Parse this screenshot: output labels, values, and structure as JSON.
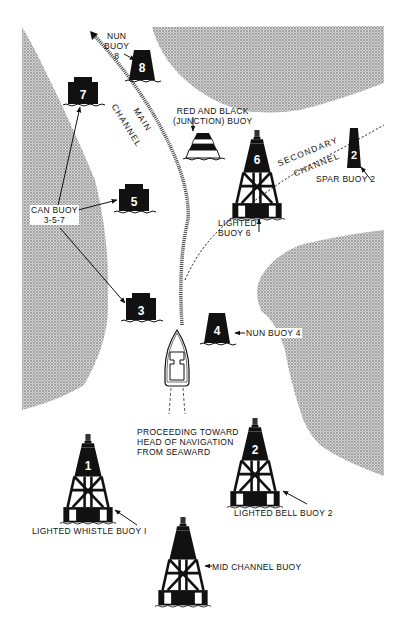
{
  "diagram": {
    "colors": {
      "land": "#b8b8b8",
      "land_dot": "#8c8c8c",
      "ink": "#111111",
      "water": "#ffffff"
    },
    "channels": {
      "main": {
        "label_line1": "MAIN",
        "label_line2": "CHANNEL"
      },
      "secondary": {
        "label_line1": "SECONDARY",
        "label_line2": "CHANNEL"
      }
    },
    "buoys": {
      "nun8": {
        "number": "8",
        "label_line1": "NUN",
        "label_line2": "BUOY",
        "label_line3": "8"
      },
      "can7": {
        "number": "7"
      },
      "can5": {
        "number": "5"
      },
      "can3": {
        "number": "3"
      },
      "can_label": {
        "line1": "CAN BUOY",
        "line2": "3-5-7"
      },
      "junction": {
        "label_line1": "RED AND BLACK",
        "label_line2": "(JUNCTION) BUOY"
      },
      "lighted6": {
        "number": "6",
        "label_line1": "LIGHTED",
        "label_line2": "BUOY 6"
      },
      "spar2": {
        "number": "2",
        "label": "SPAR BUOY 2"
      },
      "nun4": {
        "number": "4",
        "label": "NUN BUOY 4"
      },
      "whistle1": {
        "number": "1",
        "label": "LIGHTED WHISTLE BUOY I"
      },
      "bell2": {
        "number": "2",
        "label": "LIGHTED BELL BUOY 2"
      },
      "midchannel": {
        "label": "MID CHANNEL BUOY"
      }
    },
    "caption": {
      "line1": "PROCEEDING TOWARD",
      "line2": "HEAD OF NAVIGATION",
      "line3": "FROM SEAWARD"
    }
  }
}
